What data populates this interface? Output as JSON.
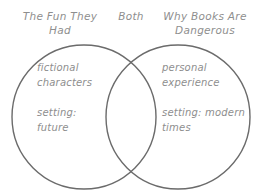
{
  "diagram": {
    "type": "venn",
    "stroke_color": "#6b6b6b",
    "text_color": "#8e8e8e",
    "background_color": "#ffffff",
    "headings": {
      "left": "The Fun They\nHad",
      "center": "Both",
      "right": "Why Books Are\nDangerous"
    },
    "left_circle": {
      "label": "The Fun They Had",
      "items": [
        "fictional\ncharacters",
        "setting:\nfuture"
      ]
    },
    "overlap": {
      "label": "Both",
      "items": []
    },
    "right_circle": {
      "label": "Why Books Are Dangerous",
      "items": [
        "personal\nexperience",
        "setting: modern\ntimes"
      ]
    }
  }
}
